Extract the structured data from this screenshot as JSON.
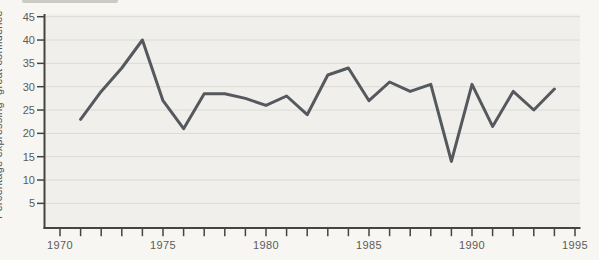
{
  "figure_name": "time-plot-of-percentage-expressing-great-confidence",
  "colors": {
    "page_bg": "#f7f6f3",
    "plot_bg": "#f0efeb",
    "grid": "#dcdbd6",
    "axis": "#45453f",
    "tick": "#45453f",
    "text": "#5c5c55",
    "line": "#55595e",
    "smudge": "#b3b2ac"
  },
  "chart_data": {
    "type": "line",
    "title": "",
    "xlabel": "",
    "ylabel": "Percentage expressing \"great confidence\"",
    "x": [
      1971,
      1972,
      1973,
      1974,
      1975,
      1976,
      1977,
      1978,
      1979,
      1980,
      1981,
      1982,
      1983,
      1984,
      1985,
      1986,
      1987,
      1988,
      1989,
      1990,
      1991,
      1992,
      1993,
      1994
    ],
    "values": [
      23,
      29,
      34,
      40,
      27,
      21,
      28.5,
      28.5,
      27.5,
      26,
      28,
      24,
      32.5,
      34,
      27,
      31,
      29,
      30.5,
      14,
      30.5,
      21.5,
      29,
      25,
      29.5
    ],
    "ylim": [
      0,
      45
    ],
    "xlim": [
      1969.2,
      1995.3
    ],
    "y_ticks": [
      5,
      10,
      15,
      20,
      25,
      30,
      35,
      40,
      45
    ],
    "x_minor_ticks": [
      1970,
      1971,
      1972,
      1973,
      1974,
      1975,
      1976,
      1977,
      1978,
      1979,
      1980,
      1981,
      1982,
      1983,
      1984,
      1985,
      1986,
      1987,
      1988,
      1989,
      1990,
      1991,
      1992,
      1993,
      1994,
      1995
    ],
    "x_labeled_ticks": [
      1970,
      1975,
      1980,
      1985,
      1990,
      1995
    ],
    "grid": "horizontal",
    "legend": "none",
    "series": [
      {
        "name": "Percentage expressing great confidence",
        "values": [
          23,
          29,
          34,
          40,
          27,
          21,
          28.5,
          28.5,
          27.5,
          26,
          28,
          24,
          32.5,
          34,
          27,
          31,
          29,
          30.5,
          14,
          30.5,
          21.5,
          29,
          25,
          29.5
        ]
      }
    ]
  }
}
